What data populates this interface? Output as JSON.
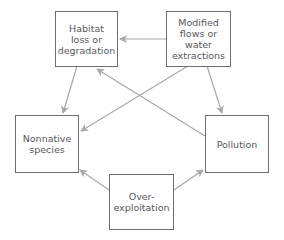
{
  "diagram": {
    "colors": {
      "box_border": "#6d6e71",
      "arrow": "#a7a9ac",
      "text": "#58595b"
    },
    "nodes": {
      "habitat": {
        "label": "Habitat\nloss or\ndegradation"
      },
      "modified": {
        "label": "Modified\nflows or\nwater\nextractions"
      },
      "nonnative": {
        "label": "Nonnative\nspecies"
      },
      "pollution": {
        "label": "Pollution"
      },
      "overexploitation": {
        "label": "Over-\nexploitation"
      }
    },
    "edges": [
      {
        "from": "Modified flows or water extractions",
        "to": "Habitat loss or degradation"
      },
      {
        "from": "Habitat loss or degradation",
        "to": "Nonnative species"
      },
      {
        "from": "Modified flows or water extractions",
        "to": "Pollution"
      },
      {
        "from": "Modified flows or water extractions",
        "to": "Nonnative species"
      },
      {
        "from": "Pollution",
        "to": "Habitat loss or degradation"
      },
      {
        "from": "Over-exploitation",
        "to": "Nonnative species"
      },
      {
        "from": "Over-exploitation",
        "to": "Pollution"
      }
    ]
  }
}
